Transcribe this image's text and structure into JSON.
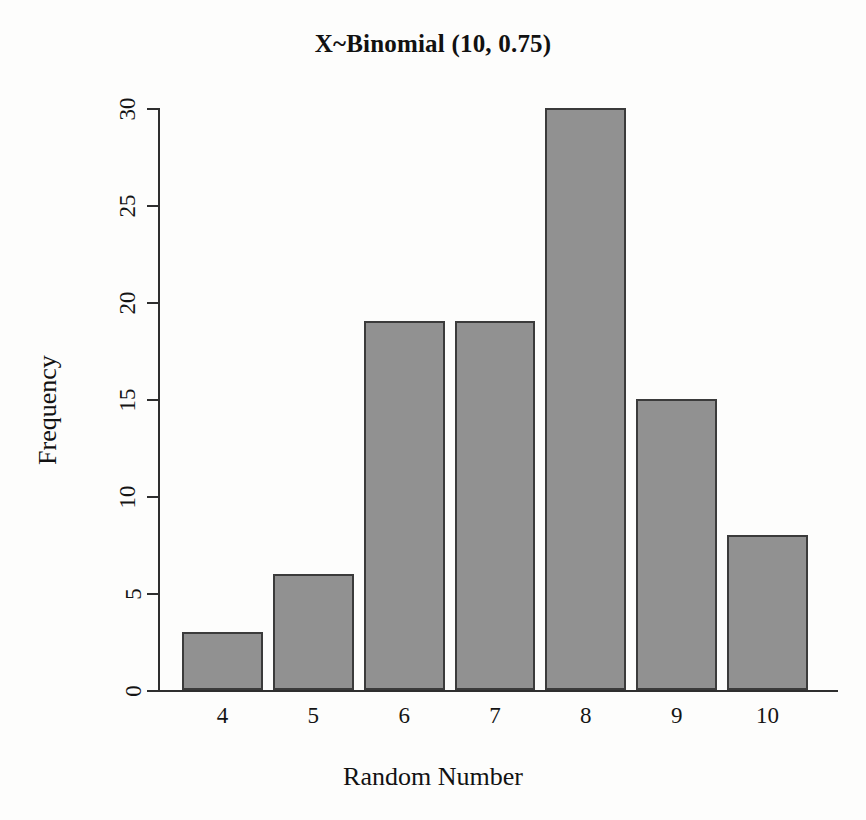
{
  "chart_data": {
    "type": "bar",
    "title": "X~Binomial (10, 0.75)",
    "xlabel": "Random Number",
    "ylabel": "Frequency",
    "categories": [
      "4",
      "5",
      "6",
      "7",
      "8",
      "9",
      "10"
    ],
    "values": [
      3,
      6,
      19,
      19,
      30,
      15,
      8
    ],
    "ylim": [
      0,
      30
    ],
    "yticks": [
      "0",
      "5",
      "10",
      "15",
      "20",
      "25",
      "30"
    ],
    "ytick_values": [
      0,
      5,
      10,
      15,
      20,
      25,
      30
    ],
    "grid": false,
    "legend": false,
    "legend_position": "none",
    "bar_fill_color": "#919191",
    "bar_border_color": "#3b3b3b",
    "axis_color": "#2e2e2e",
    "background_color": "#fdfdfc"
  }
}
